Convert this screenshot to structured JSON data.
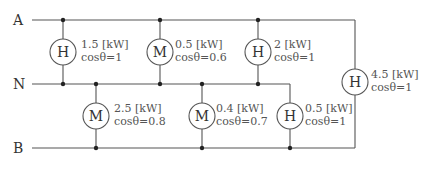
{
  "buses": [
    {
      "id": "A",
      "label": "A"
    },
    {
      "id": "N",
      "label": "N"
    },
    {
      "id": "B",
      "label": "B"
    }
  ],
  "loads": [
    {
      "id": "load-a-n-1",
      "type": "H",
      "power": "1.5 [kW]",
      "pf": "cosθ=1",
      "between": "A-N"
    },
    {
      "id": "load-a-n-2",
      "type": "M",
      "power": "0.5 [kW]",
      "pf": "cosθ=0.6",
      "between": "A-N"
    },
    {
      "id": "load-a-n-3",
      "type": "H",
      "power": "2 [kW]",
      "pf": "cosθ=1",
      "between": "A-N"
    },
    {
      "id": "load-a-b-1",
      "type": "H",
      "power": "4.5 [kW]",
      "pf": "cosθ=1",
      "between": "A-B"
    },
    {
      "id": "load-n-b-1",
      "type": "M",
      "power": "2.5 [kW]",
      "pf": "cosθ=0.8",
      "between": "N-B"
    },
    {
      "id": "load-n-b-2",
      "type": "M",
      "power": "0.4 [kW]",
      "pf": "cosθ=0.7",
      "between": "N-B"
    },
    {
      "id": "load-n-b-3",
      "type": "H",
      "power": "0.5 [kW]",
      "pf": "cosθ=1",
      "between": "N-B"
    }
  ]
}
